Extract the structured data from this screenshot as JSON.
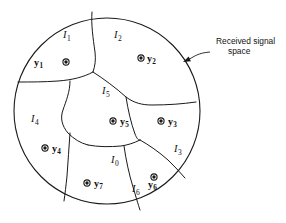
{
  "figure": {
    "type": "diagram",
    "background_color": "#ffffff",
    "line_color": "#1a1a1a",
    "canvas": {
      "width": 286,
      "height": 223
    }
  },
  "signal_space": {
    "shape": "circle",
    "center_x": 107,
    "center_y": 111,
    "radius": 93
  },
  "callout": {
    "line1": "Received signal",
    "line2": "space",
    "text_x": 216,
    "text_y": 44,
    "arrow_tip_x": 183,
    "arrow_tip_y": 62
  },
  "regions": [
    {
      "id": "I1",
      "base": "I",
      "sub": "1",
      "x": 63,
      "y": 38
    },
    {
      "id": "I2",
      "base": "I",
      "sub": "2",
      "x": 114,
      "y": 38
    },
    {
      "id": "I5",
      "base": "I",
      "sub": "5",
      "x": 102,
      "y": 94
    },
    {
      "id": "I4",
      "base": "I",
      "sub": "4",
      "x": 31,
      "y": 122
    },
    {
      "id": "I3",
      "base": "I",
      "sub": "3",
      "x": 174,
      "y": 152
    },
    {
      "id": "I0",
      "base": "I",
      "sub": "0",
      "x": 111,
      "y": 163
    },
    {
      "id": "I6",
      "base": "I",
      "sub": "6",
      "x": 132,
      "y": 192
    }
  ],
  "points": [
    {
      "id": "y1",
      "base": "y",
      "sub": "1",
      "label_x": 43,
      "label_y": 66,
      "dot_x": 66,
      "dot_y": 62,
      "label_side": "left"
    },
    {
      "id": "y2",
      "base": "y",
      "sub": "2",
      "label_x": 147,
      "label_y": 62,
      "dot_x": 141,
      "dot_y": 58,
      "label_side": "right"
    },
    {
      "id": "y3",
      "base": "y",
      "sub": "3",
      "label_x": 168,
      "label_y": 125,
      "dot_x": 161,
      "dot_y": 121,
      "label_side": "right"
    },
    {
      "id": "y4",
      "base": "y",
      "sub": "4",
      "label_x": 52,
      "label_y": 152,
      "dot_x": 45,
      "dot_y": 148,
      "label_side": "right"
    },
    {
      "id": "y5",
      "base": "y",
      "sub": "5",
      "label_x": 120,
      "label_y": 125,
      "dot_x": 113,
      "dot_y": 121,
      "label_side": "right"
    },
    {
      "id": "y6",
      "base": "y",
      "sub": "6",
      "label_x": 148,
      "label_y": 188,
      "dot_x": 154,
      "dot_y": 177,
      "label_side": "below"
    },
    {
      "id": "y7",
      "base": "y",
      "sub": "7",
      "label_x": 94,
      "label_y": 187,
      "dot_x": 87,
      "dot_y": 183,
      "label_side": "right"
    }
  ],
  "boundaries": [
    {
      "name": "I1-I2-divider",
      "d": "M 92 12 C 91 24, 93 38, 95 52 C 96 60, 95 66, 93 72"
    },
    {
      "name": "I1-I4-I5-divider",
      "d": "M 93 72 C 84 77, 72 80, 58 81 C 44 82, 31 82, 18 82"
    },
    {
      "name": "I2-I5-I3-divider",
      "d": "M 93 72 C 104 79, 116 88, 126 97 C 134 103, 142 105, 152 105 C 168 105, 182 104, 196 102"
    },
    {
      "name": "I5-I4-divider",
      "d": "M 70 81 C 70 92, 66 101, 63 110 C 60 118, 62 126, 68 133 C 74 139, 80 143, 88 145"
    },
    {
      "name": "I5-I0-divider",
      "d": "M 88 145 C 98 147, 110 147, 121 146 C 128 145, 134 143, 140 140"
    },
    {
      "name": "I3-I5-I0-divider",
      "d": "M 126 97 C 128 110, 131 123, 135 134 C 137 139, 139 141, 140 140"
    },
    {
      "name": "I3-I6-divider",
      "d": "M 140 140 C 149 145, 159 152, 168 160 C 174 166, 180 172, 185 178"
    },
    {
      "name": "I0-I6-divider",
      "d": "M 124 146 C 126 160, 129 174, 133 187 C 136 197, 138 204, 140 210"
    },
    {
      "name": "I4-I7-divider",
      "d": "M 70 133 C 69 147, 68 162, 67 176 C 66 186, 65 194, 64 201"
    }
  ]
}
